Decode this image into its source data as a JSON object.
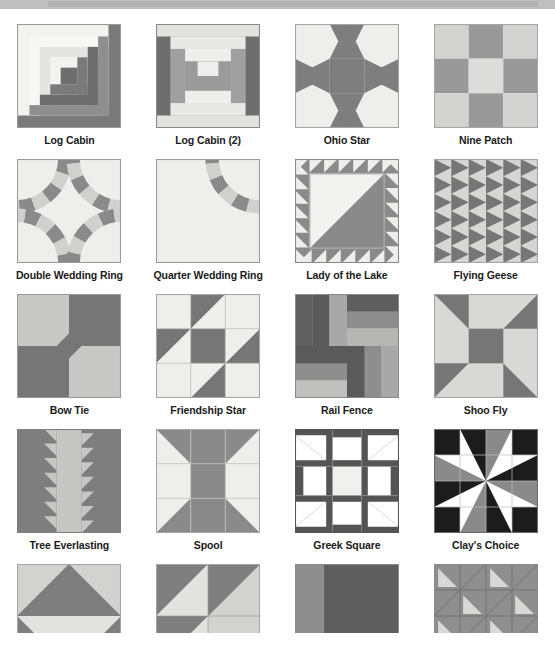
{
  "page": {
    "topbar_color": "#bfbfbf",
    "background_color": "#ffffff"
  },
  "palette": {
    "light": "#e8e8e6",
    "light_alt": "#f0f0ee",
    "medium": "#a8a8a8",
    "medium_dark": "#8c8c8c",
    "dark": "#6e6e6e",
    "black": "#1c1c1c",
    "white": "#ffffff",
    "outline": "#9a9a9a"
  },
  "blocks": [
    {
      "id": "log-cabin",
      "label": "Log Cabin",
      "row": 1,
      "col": 1,
      "cropped": false
    },
    {
      "id": "log-cabin-2",
      "label": "Log Cabin (2)",
      "row": 1,
      "col": 2,
      "cropped": false
    },
    {
      "id": "ohio-star",
      "label": "Ohio Star",
      "row": 1,
      "col": 3,
      "cropped": false
    },
    {
      "id": "nine-patch",
      "label": "Nine Patch",
      "row": 1,
      "col": 4,
      "cropped": false
    },
    {
      "id": "double-wedding-ring",
      "label": "Double Wedding Ring",
      "row": 2,
      "col": 1,
      "cropped": false
    },
    {
      "id": "quarter-wedding-ring",
      "label": "Quarter Wedding Ring",
      "row": 2,
      "col": 2,
      "cropped": false
    },
    {
      "id": "lady-of-the-lake",
      "label": "Lady of the Lake",
      "row": 2,
      "col": 3,
      "cropped": false
    },
    {
      "id": "flying-geese",
      "label": "Flying Geese",
      "row": 2,
      "col": 4,
      "cropped": false
    },
    {
      "id": "bow-tie",
      "label": "Bow Tie",
      "row": 3,
      "col": 1,
      "cropped": false
    },
    {
      "id": "friendship-star",
      "label": "Friendship Star",
      "row": 3,
      "col": 2,
      "cropped": false
    },
    {
      "id": "rail-fence",
      "label": "Rail Fence",
      "row": 3,
      "col": 3,
      "cropped": false
    },
    {
      "id": "shoo-fly",
      "label": "Shoo Fly",
      "row": 3,
      "col": 4,
      "cropped": false
    },
    {
      "id": "tree-everlasting",
      "label": "Tree Everlasting",
      "row": 4,
      "col": 1,
      "cropped": false
    },
    {
      "id": "spool",
      "label": "Spool",
      "row": 4,
      "col": 2,
      "cropped": false
    },
    {
      "id": "greek-square",
      "label": "Greek Square",
      "row": 4,
      "col": 3,
      "cropped": false
    },
    {
      "id": "clays-choice",
      "label": "Clay's Choice",
      "row": 4,
      "col": 4,
      "cropped": false
    },
    {
      "id": "pinwheel-hst",
      "label": "",
      "row": 5,
      "col": 1,
      "cropped": true
    },
    {
      "id": "birds-in-air",
      "label": "",
      "row": 5,
      "col": 2,
      "cropped": true
    },
    {
      "id": "corner-square",
      "label": "",
      "row": 5,
      "col": 3,
      "cropped": true
    },
    {
      "id": "sawtooth-grid",
      "label": "",
      "row": 5,
      "col": 4,
      "cropped": true
    }
  ],
  "captions": {
    "log_cabin": "Log Cabin",
    "log_cabin_2": "Log Cabin (2)",
    "ohio_star": "Ohio Star",
    "nine_patch": "Nine Patch",
    "double_wedding_ring": "Double Wedding Ring",
    "quarter_wedding_ring": "Quarter Wedding Ring",
    "lady_of_the_lake": "Lady of the Lake",
    "flying_geese": "Flying Geese",
    "bow_tie": "Bow Tie",
    "friendship_star": "Friendship Star",
    "rail_fence": "Rail Fence",
    "shoo_fly": "Shoo Fly",
    "tree_everlasting": "Tree Everlasting",
    "spool": "Spool",
    "greek_square": "Greek Square",
    "clays_choice": "Clay's Choice"
  }
}
